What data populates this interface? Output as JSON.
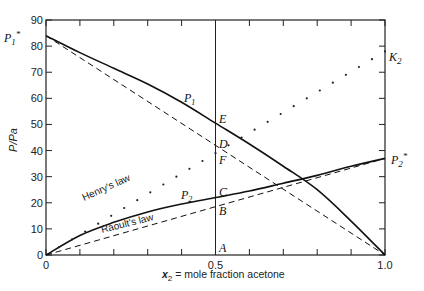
{
  "chart_data": {
    "type": "line",
    "title": "",
    "xlabel": "x2 = mole fraction acetone",
    "ylabel": "P/Pa",
    "xlim": [
      0,
      1.0
    ],
    "ylim": [
      0,
      90
    ],
    "x_ticks": [
      0,
      0.5,
      1.0
    ],
    "x_tick_labels": [
      "0",
      "0.5",
      "1.0"
    ],
    "x_minor_ticks": [
      0.1,
      0.2,
      0.3,
      0.4,
      0.6,
      0.7,
      0.8,
      0.9
    ],
    "y_ticks": [
      0,
      10,
      20,
      30,
      40,
      50,
      60,
      70,
      80,
      90
    ],
    "y_tick_labels": [
      "0",
      "10",
      "20",
      "30",
      "40",
      "50",
      "60",
      "70",
      "80",
      "90"
    ],
    "grid": false,
    "legend": null,
    "series": [
      {
        "name": "P1",
        "style": "solid",
        "x": [
          0,
          0.1,
          0.2,
          0.3,
          0.4,
          0.5,
          0.6,
          0.7,
          0.8,
          0.9,
          1.0
        ],
        "values": [
          84,
          77.5,
          71.5,
          65.5,
          58.5,
          50.5,
          42.5,
          34,
          25,
          13,
          0
        ]
      },
      {
        "name": "P2",
        "style": "solid",
        "x": [
          0,
          0.1,
          0.2,
          0.3,
          0.4,
          0.5,
          0.6,
          0.7,
          0.8,
          0.9,
          1.0
        ],
        "values": [
          0,
          7.5,
          12.5,
          16.5,
          19.5,
          22,
          24.5,
          27.5,
          30.5,
          34,
          37
        ]
      },
      {
        "name": "Raoult's law (component 1)",
        "style": "dashed",
        "x": [
          0,
          1.0
        ],
        "values": [
          84,
          0
        ]
      },
      {
        "name": "Raoult's law (component 2)",
        "style": "dashed",
        "x": [
          0,
          1.0
        ],
        "values": [
          0,
          37
        ]
      },
      {
        "name": "Henry's law",
        "style": "dotted",
        "x": [
          0,
          1.0
        ],
        "values": [
          0,
          78
        ]
      }
    ],
    "vertical_line": {
      "x": 0.5
    },
    "annotations": [
      {
        "text": "P1*",
        "x": 0,
        "y": 84,
        "side": "left"
      },
      {
        "text": "P2*",
        "x": 1.0,
        "y": 37,
        "side": "right"
      },
      {
        "text": "K2",
        "x": 1.0,
        "y": 78,
        "side": "right"
      },
      {
        "text": "P1",
        "x": 0.38,
        "y": 60
      },
      {
        "text": "P2",
        "x": 0.33,
        "y": 17
      },
      {
        "text": "E",
        "x": 0.5,
        "y": 50.5
      },
      {
        "text": "D",
        "x": 0.5,
        "y": 42
      },
      {
        "text": "F",
        "x": 0.5,
        "y": 39
      },
      {
        "text": "C",
        "x": 0.5,
        "y": 22
      },
      {
        "text": "B",
        "x": 0.5,
        "y": 18.5
      },
      {
        "text": "A",
        "x": 0.5,
        "y": 0
      },
      {
        "text": "Henry's law",
        "x": 0.2,
        "y": 25
      },
      {
        "text": "Raoult's law",
        "x": 0.25,
        "y": 8
      }
    ]
  },
  "labels": {
    "p1_star": "P",
    "p1_star_sub": "1",
    "p2_star": "P",
    "p2_star_sub": "2",
    "k2": "K",
    "k2_sub": "2",
    "p1": "P",
    "p1_sub": "1",
    "p2": "P",
    "p2_sub": "2",
    "E": "E",
    "D": "D",
    "F": "F",
    "C": "C",
    "B": "B",
    "A": "A",
    "henry": "Henry's law",
    "raoult": "Raoult's law",
    "ylabel": "P/Pa",
    "xlabel_var": "x",
    "xlabel_sub": "2",
    "xlabel_rest": " = mole fraction acetone"
  }
}
